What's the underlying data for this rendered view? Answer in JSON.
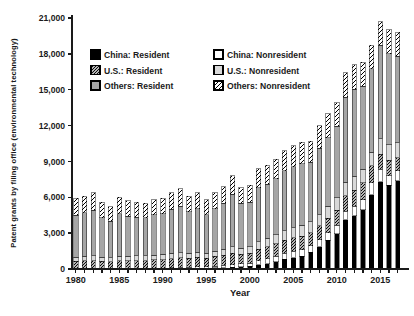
{
  "chart": {
    "ylabel": "Patent grants by filing office (environmental technology)",
    "xlabel": "Year"
  },
  "chart_data": {
    "type": "bar",
    "stacked": true,
    "title": "",
    "xlabel": "Year",
    "ylabel": "Patent grants by filing office (environmental technology)",
    "ylim": [
      0,
      21000
    ],
    "yticks": [
      0,
      3000,
      6000,
      9000,
      12000,
      15000,
      18000,
      21000
    ],
    "xtick_labels": [
      1980,
      1985,
      1990,
      1995,
      2000,
      2005,
      2010,
      2015
    ],
    "grid": false,
    "legend_position": "upper-left-inside",
    "colors": {
      "black": "#000000",
      "white": "#ffffff",
      "mid_gray": "#a6a6a6",
      "light_gray": "#d9d9d9",
      "axis": "#1a1a1a"
    },
    "categories": [
      1980,
      1981,
      1982,
      1983,
      1984,
      1985,
      1986,
      1987,
      1988,
      1989,
      1990,
      1991,
      1992,
      1993,
      1994,
      1995,
      1996,
      1997,
      1998,
      1999,
      2000,
      2001,
      2002,
      2003,
      2004,
      2005,
      2006,
      2007,
      2008,
      2009,
      2010,
      2011,
      2012,
      2013,
      2014,
      2015,
      2016,
      2017
    ],
    "series": [
      {
        "key": "china-resident",
        "name": "China: Resident",
        "fill": "#000000",
        "values": [
          0,
          0,
          0,
          0,
          0,
          10,
          10,
          20,
          20,
          30,
          30,
          40,
          50,
          60,
          70,
          80,
          100,
          120,
          150,
          180,
          250,
          350,
          450,
          600,
          800,
          950,
          1050,
          1400,
          1850,
          2400,
          2950,
          4100,
          4450,
          4950,
          6200,
          7300,
          7000,
          7400
        ]
      },
      {
        "key": "china-nonresident",
        "name": "China: Nonresident",
        "fill": "#ffffff",
        "values": [
          0,
          0,
          0,
          0,
          0,
          20,
          20,
          30,
          30,
          40,
          40,
          60,
          80,
          90,
          110,
          120,
          150,
          180,
          220,
          250,
          250,
          350,
          420,
          450,
          500,
          550,
          550,
          550,
          600,
          650,
          700,
          750,
          800,
          850,
          1000,
          1050,
          800,
          800
        ]
      },
      {
        "key": "us-resident",
        "name": "U.S.: Resident",
        "fill": "pattern:hatch-dense",
        "values": [
          650,
          700,
          700,
          650,
          600,
          650,
          650,
          650,
          650,
          700,
          700,
          750,
          800,
          750,
          800,
          700,
          800,
          850,
          950,
          800,
          800,
          950,
          1000,
          1050,
          1100,
          1100,
          1150,
          1100,
          1150,
          1200,
          1250,
          1300,
          1350,
          1400,
          1450,
          1250,
          1300,
          1100
        ]
      },
      {
        "key": "us-nonresident",
        "name": "U.S.: Nonresident",
        "fill": "#d9d9d9",
        "values": [
          350,
          350,
          400,
          350,
          350,
          400,
          400,
          400,
          400,
          400,
          450,
          450,
          450,
          400,
          420,
          400,
          450,
          500,
          550,
          500,
          550,
          650,
          700,
          750,
          800,
          850,
          900,
          900,
          950,
          1000,
          1050,
          1100,
          1150,
          1150,
          1100,
          1300,
          1300,
          1250
        ]
      },
      {
        "key": "others-resident",
        "name": "Others: Resident",
        "fill": "#a6a6a6",
        "values": [
          3500,
          3650,
          3800,
          3300,
          3050,
          3550,
          3350,
          3250,
          3200,
          3350,
          3400,
          3700,
          3870,
          3500,
          3650,
          3250,
          3550,
          3850,
          4380,
          3770,
          3750,
          4500,
          4530,
          4700,
          5000,
          5100,
          5150,
          5000,
          5550,
          5750,
          6000,
          7100,
          7300,
          6950,
          7000,
          7800,
          7600,
          7250
        ]
      },
      {
        "key": "others-nonresident",
        "name": "Others: Nonresident",
        "fill": "pattern:hatch-light",
        "values": [
          1400,
          1400,
          1500,
          1300,
          1200,
          1370,
          1270,
          1250,
          1200,
          1280,
          1280,
          1400,
          1450,
          1300,
          1350,
          1250,
          1350,
          1400,
          1550,
          1300,
          1400,
          1600,
          1600,
          1650,
          1700,
          1750,
          1800,
          1750,
          1900,
          2000,
          1950,
          2050,
          2050,
          2000,
          1950,
          2000,
          2000,
          2000
        ]
      }
    ],
    "legend_columns": [
      [
        "china-resident",
        "us-resident",
        "others-resident"
      ],
      [
        "china-nonresident",
        "us-nonresident",
        "others-nonresident"
      ]
    ]
  }
}
